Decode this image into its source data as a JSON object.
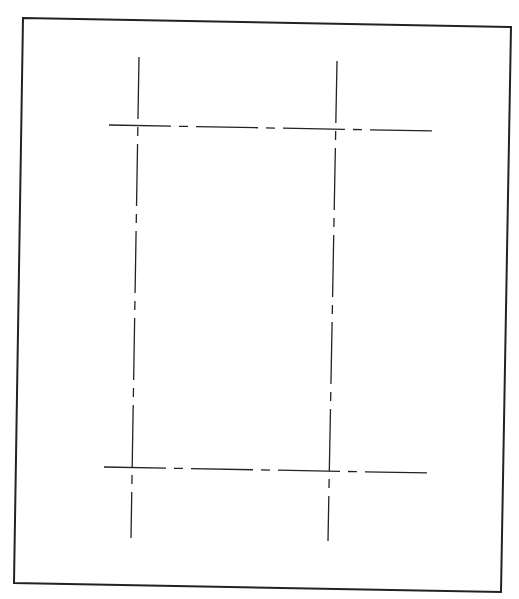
{
  "drawing": {
    "background": "#ffffff",
    "ink_color": "#222222",
    "frame": {
      "points": [
        [
          23,
          18
        ],
        [
          511,
          27
        ],
        [
          501,
          592
        ],
        [
          14,
          583
        ]
      ],
      "stroke_width": 2
    },
    "centerlines": {
      "dash_pattern": "62 8 9 8",
      "stroke_width": 1.3,
      "vertical": [
        {
          "id": "left-vertical",
          "x1": 139,
          "y1": 57,
          "x2": 131,
          "y2": 538
        },
        {
          "id": "right-vertical",
          "x1": 337,
          "y1": 61,
          "x2": 328,
          "y2": 541
        }
      ],
      "horizontal": [
        {
          "id": "top-horizontal",
          "x1": 109,
          "y1": 125,
          "x2": 435,
          "y2": 131
        },
        {
          "id": "bottom-horizontal",
          "x1": 104,
          "y1": 467,
          "x2": 429,
          "y2": 473
        }
      ]
    }
  }
}
